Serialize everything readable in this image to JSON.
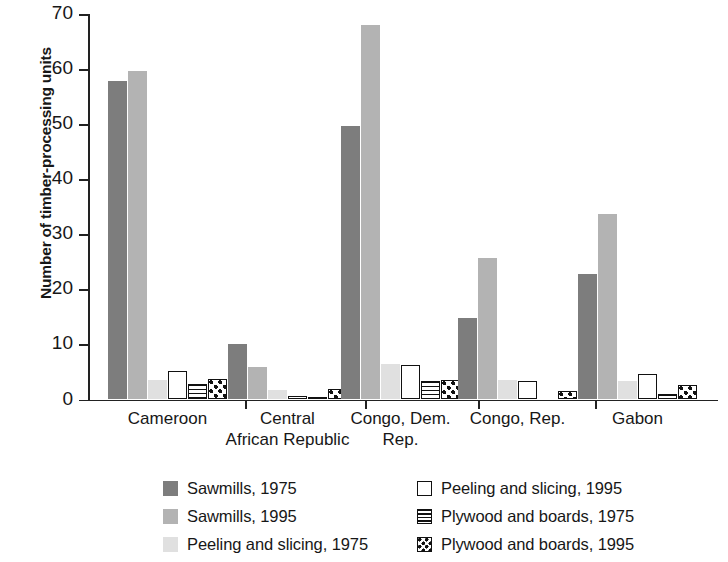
{
  "chart_data": {
    "type": "bar",
    "title": "",
    "subtitle": "",
    "xlabel": "",
    "ylabel": "Number of timber-processing units",
    "ylim": [
      0,
      70
    ],
    "yticks": [
      0,
      10,
      20,
      30,
      40,
      50,
      60,
      70
    ],
    "ytick_labels": [
      "0",
      "10",
      "20",
      "30",
      "40",
      "50",
      "60",
      "70"
    ],
    "grid": false,
    "legend_position": "bottom",
    "categories": [
      "Cameroon",
      "Central\nAfrican Republic",
      "Congo, Dem.\nRep.",
      "Congo, Rep.",
      "Gabon"
    ],
    "category_labels_flat": [
      "Cameroon",
      "Central African Republic",
      "Congo, Dem. Rep.",
      "Congo, Rep.",
      "Gabon"
    ],
    "series": [
      {
        "name": "Sawmills, 1975",
        "key": "sawmills-1975",
        "color": "#7d7d7d",
        "pattern": "solid-dark-gray",
        "values": [
          57.8,
          10.1,
          49.6,
          14.8,
          22.8
        ]
      },
      {
        "name": "Sawmills, 1995",
        "key": "sawmills-1995",
        "color": "#b3b3b3",
        "pattern": "solid-medium-gray",
        "values": [
          59.6,
          5.9,
          67.9,
          25.7,
          33.6
        ]
      },
      {
        "name": "Peeling and slicing, 1975",
        "key": "peeling-slicing-1975",
        "color": "#e0e0e0",
        "pattern": "solid-light-gray",
        "values": [
          3.6,
          1.8,
          6.5,
          3.5,
          3.4
        ]
      },
      {
        "name": "Peeling and slicing, 1995",
        "key": "peeling-slicing-1995",
        "color": "#ffffff",
        "pattern": "white-outline",
        "values": [
          5.1,
          0.6,
          6.3,
          3.4,
          4.7
        ]
      },
      {
        "name": "Plywood and boards, 1975",
        "key": "plywood-boards-1975",
        "color": "#ffffff",
        "pattern": "horizontal-stripes",
        "values": [
          2.8,
          0.5,
          3.4,
          0.0,
          1.0
        ]
      },
      {
        "name": "Plywood and boards, 1995",
        "key": "plywood-boards-1995",
        "color": "#ffffff",
        "pattern": "checkerboard-dots",
        "values": [
          3.7,
          1.9,
          3.6,
          1.6,
          2.6
        ]
      }
    ]
  }
}
